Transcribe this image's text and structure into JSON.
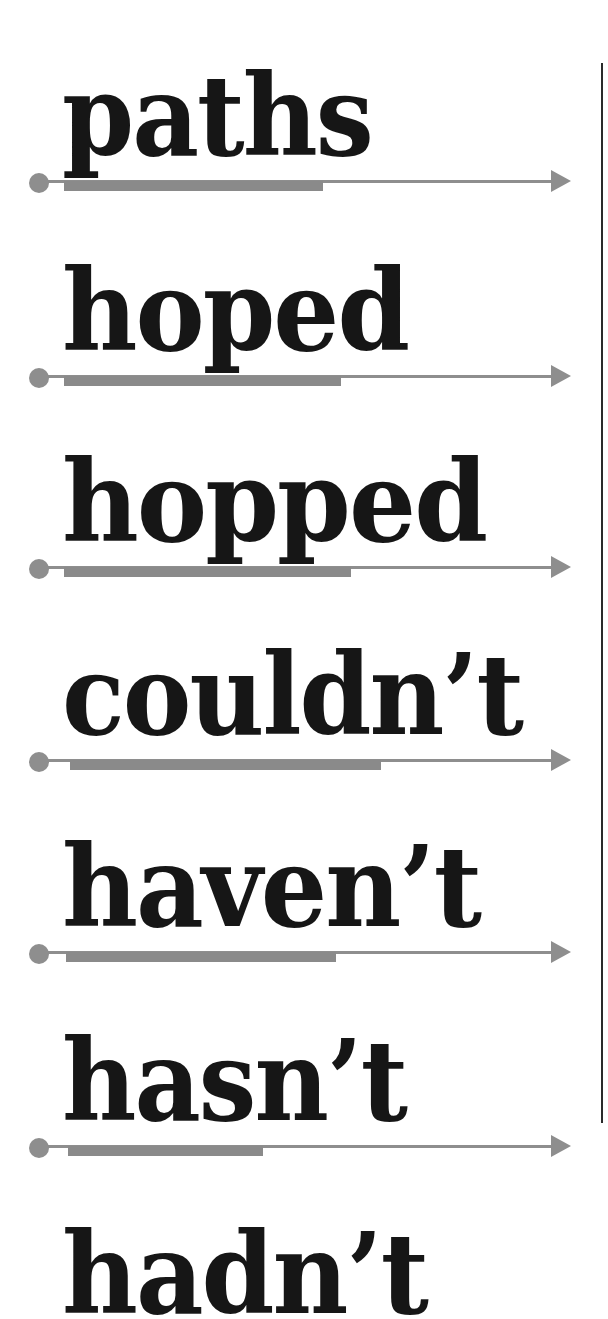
{
  "colors": {
    "text": "#161616",
    "track": "#8e8e8e",
    "bar": "#8a8a8a",
    "divider": "#2a2a2a"
  },
  "rows": [
    {
      "word": "paths",
      "line_y": 181,
      "bar_start": 64,
      "bar_end": 323
    },
    {
      "word": "hoped",
      "line_y": 376,
      "bar_start": 64,
      "bar_end": 341
    },
    {
      "word": "hopped",
      "line_y": 567,
      "bar_start": 64,
      "bar_end": 351
    },
    {
      "word": "couldn’t",
      "line_y": 760,
      "bar_start": 70,
      "bar_end": 381
    },
    {
      "word": "haven’t",
      "line_y": 952,
      "bar_start": 66,
      "bar_end": 336
    },
    {
      "word": "hasn’t",
      "line_y": 1146,
      "bar_start": 68,
      "bar_end": 263
    },
    {
      "word": "hadn’t",
      "line_y": null,
      "bar_start": null,
      "bar_end": null
    }
  ],
  "word_widths": [
    310,
    346,
    424,
    460,
    418,
    344,
    365
  ],
  "arrow_tip_x": 571
}
